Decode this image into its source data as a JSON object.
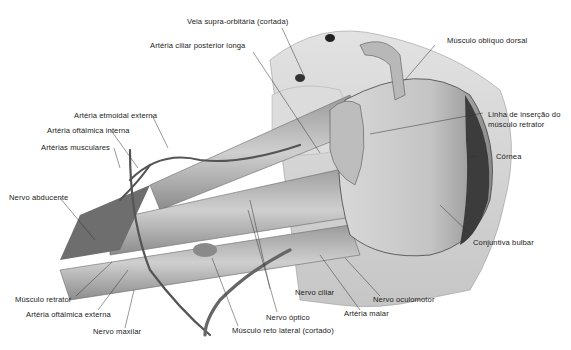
{
  "figure": {
    "labels": {
      "veia_supra_orbitaria": "Veia supra-orbitária (cortada)",
      "arteria_ciliar_posterior_longa": "Artéria ciliar posterior longa",
      "musculo_obliquo_dorsal": "Músculo oblíquo dorsal",
      "linha_insercao_1": "Linha de inserção do",
      "linha_insercao_2": "músculo retrator",
      "cornea": "Córnea",
      "conjuntiva_bulbar": "Conjuntiva bulbar",
      "arteria_etmoidal_externa": "Artéria etmoidal externa",
      "arteria_oftalmica_interna": "Artéria oftálmica interna",
      "arterias_musculares": "Artérias musculares",
      "nervo_abducente": "Nervo abducente",
      "musculo_retrator": "Músculo retrator",
      "arteria_oftalmica_externa": "Artéria oftálmica externa",
      "nervo_maxilar": "Nervo maxilar",
      "nervo_ciliar": "Nervo ciliar",
      "nervo_optico": "Nervo óptico",
      "musculo_reto_lateral": "Músculo reto lateral (cortado)",
      "arteria_malar": "Artéria malar",
      "nervo_oculomotor": "Nervo oculomotor"
    }
  }
}
